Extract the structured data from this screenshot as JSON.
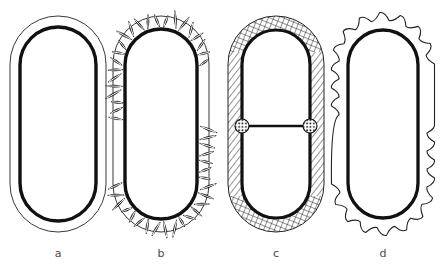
{
  "figure": {
    "type": "scientific-line-drawing",
    "background_color": "#ffffff",
    "ink_color": "#111111",
    "label_color": "#4a4a4a",
    "panels": [
      {
        "id": "a",
        "label": "a",
        "label_x": 58,
        "label_y": 257,
        "center_x": 58,
        "wall_style": "smooth double wall",
        "outer": {
          "cx": 58,
          "cy": 124,
          "rx": 48,
          "ry": 108,
          "stroke_width": 0.9
        },
        "inner": {
          "cx": 58,
          "cy": 124,
          "rx": 38,
          "ry": 97,
          "stroke_width": 3.4
        },
        "features": []
      },
      {
        "id": "b",
        "label": "b",
        "label_x": 161,
        "label_y": 257,
        "center_x": 161,
        "wall_style": "leaf-shaped radial appendages in wall space",
        "outer": {
          "cx": 161,
          "cy": 124,
          "rx": 48,
          "ry": 108,
          "stroke_width": 0.9
        },
        "inner": {
          "cx": 161,
          "cy": 124,
          "rx": 36,
          "ry": 95,
          "stroke_width": 3.4
        },
        "features": [
          {
            "name": "leaf-appendage",
            "count": 46,
            "shape": "pointed-ellipse",
            "length": 15,
            "width": 4.6
          }
        ]
      },
      {
        "id": "c",
        "label": "c",
        "label_x": 276,
        "label_y": 257,
        "center_x": 276,
        "wall_style": "diagonal hatched side walls, cross-hatched end caps, central septum",
        "outer": {
          "cx": 276,
          "cy": 124,
          "rx": 48,
          "ry": 108,
          "stroke_width": 1.0
        },
        "inner": {
          "cx": 276,
          "cy": 124,
          "rx": 34,
          "ry": 94,
          "stroke_width": 3.2
        },
        "features": [
          {
            "name": "septum",
            "orientation": "horizontal",
            "y": 126,
            "x1": 242,
            "x2": 310,
            "stroke_width": 2.6
          },
          {
            "name": "septum-node-left",
            "cx": 242,
            "cy": 126,
            "r": 7
          },
          {
            "name": "septum-node-right",
            "cx": 310,
            "cy": 126,
            "r": 7
          },
          {
            "name": "wall-hatching",
            "pattern": "diagonal-lines",
            "spacing": 5
          },
          {
            "name": "cap-hatching",
            "pattern": "cross-hatch",
            "spacing": 5
          }
        ]
      },
      {
        "id": "d",
        "label": "d",
        "label_x": 383,
        "label_y": 257,
        "center_x": 383,
        "wall_style": "cog-like lobed outer wall with smooth inner capsule",
        "outer": {
          "cx": 383,
          "cy": 124,
          "rx": 44,
          "ry": 104,
          "stroke_width": 1.1,
          "lobes": 22
        },
        "inner": {
          "cx": 383,
          "cy": 124,
          "rx": 35,
          "ry": 94,
          "stroke_width": 3.3
        },
        "features": [
          {
            "name": "wall-lobe",
            "count": 22,
            "shape": "rounded-bump"
          }
        ]
      }
    ]
  }
}
